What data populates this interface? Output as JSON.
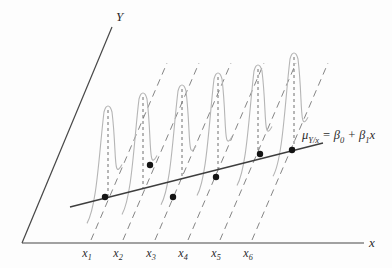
{
  "figure": {
    "title_semantic": "linear-regression-conditional-distributions-diagram",
    "y_axis_label": "Y",
    "x_axis_label": "x",
    "x_ticks": [
      {
        "base": "x",
        "sub": "1"
      },
      {
        "base": "x",
        "sub": "2"
      },
      {
        "base": "x",
        "sub": "3"
      },
      {
        "base": "x",
        "sub": "4"
      },
      {
        "base": "x",
        "sub": "5"
      },
      {
        "base": "x",
        "sub": "6"
      }
    ],
    "equation_segments": [
      {
        "t": "μ"
      },
      {
        "t": "Y/x",
        "sub": true
      },
      {
        "t": " = β"
      },
      {
        "t": "0",
        "sub": true
      },
      {
        "t": " + β"
      },
      {
        "t": "1",
        "sub": true
      },
      {
        "t": "x"
      }
    ],
    "colors": {
      "background": "#fdfdfd",
      "axis": "#474747",
      "regression_line": "#3d3d3d",
      "curve": "#b5b5b5",
      "slant_dash": "#858585",
      "mean_dash": "#6e6e6e",
      "dot": "#141414",
      "text": "#2b2b2b"
    },
    "geometry": {
      "canvas": [
        392,
        268
      ],
      "origin": [
        22,
        243
      ],
      "x_axis_end": [
        364,
        243
      ],
      "y_axis_top": [
        112,
        27
      ],
      "x_label_pos": [
        369,
        236
      ],
      "y_label_pos": [
        116,
        10
      ],
      "regression_line": {
        "from": [
          70,
          207
        ],
        "to": [
          323,
          143
        ]
      },
      "equation_anchor": [
        302,
        129
      ],
      "tick_y": 247,
      "tick_x": [
        87,
        118,
        151,
        183,
        216,
        248
      ],
      "slant_base_y": 240,
      "slant_dx": 76,
      "slant_dy": -177,
      "slant_base_x": [
        91,
        123,
        155,
        188,
        220,
        252
      ],
      "curve_peaks": [
        [
          108,
          103
        ],
        [
          143,
          90
        ],
        [
          182,
          82
        ],
        [
          218,
          70
        ],
        [
          258,
          62
        ],
        [
          294,
          50
        ]
      ],
      "data_points": [
        [
          105,
          197
        ],
        [
          150,
          165
        ],
        [
          173,
          197
        ],
        [
          216,
          177
        ],
        [
          260,
          154
        ],
        [
          292,
          150
        ]
      ]
    }
  }
}
